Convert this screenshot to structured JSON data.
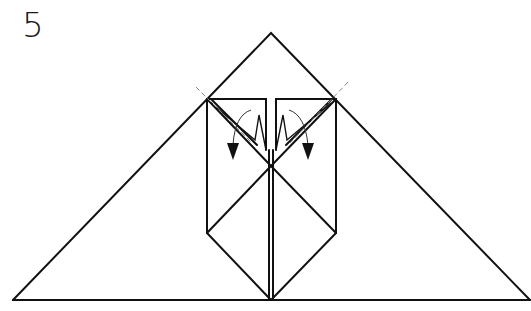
{
  "diagram": {
    "type": "origami-folding-step",
    "step_number": "5",
    "colors": {
      "line": "#111111",
      "dashed_fold": "#8a8a8a",
      "background": "#ffffff"
    },
    "elements": {
      "outer_triangle": "large base triangle",
      "inner_flap_left": "left vertical panel with folded corner",
      "inner_flap_right": "right vertical panel with folded corner",
      "valley_fold_lines": [
        "left diagonal dashed fold",
        "right diagonal dashed fold"
      ],
      "fold_arrows": [
        "left curved arrow pointing down",
        "right curved arrow pointing down"
      ]
    }
  }
}
